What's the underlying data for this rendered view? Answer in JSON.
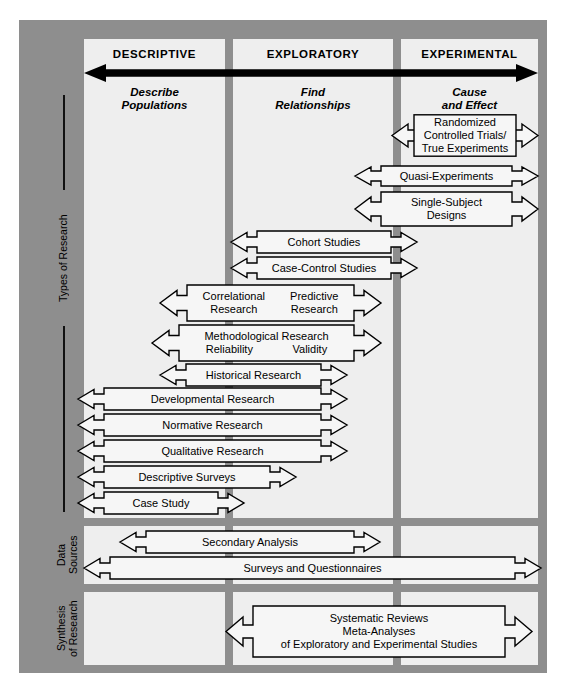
{
  "columns": [
    {
      "heading": "DESCRIPTIVE",
      "subtitle_line1": "Describe",
      "subtitle_line2": "Populations"
    },
    {
      "heading": "EXPLORATORY",
      "subtitle_line1": "Find",
      "subtitle_line2": "Relationships"
    },
    {
      "heading": "EXPERIMENTAL",
      "subtitle_line1": "Cause",
      "subtitle_line2": "and Effect"
    }
  ],
  "continuum_arrow": {
    "name": "double-headed-continuum-arrow",
    "color": "#000000"
  },
  "row_labels": [
    {
      "id": "types-of-research",
      "text": "Types of Research"
    },
    {
      "id": "data-sources",
      "line1": "Data",
      "line2": "Sources"
    },
    {
      "id": "synthesis-of-research",
      "line1": "Synthesis",
      "line2": "of Research"
    }
  ],
  "bands": {
    "types_of_research": [
      {
        "id": "randomized-controlled-trials",
        "lines": [
          "Randomized",
          "Controlled Trials/",
          "True Experiments"
        ],
        "span": "experimental"
      },
      {
        "id": "quasi-experiments",
        "lines": [
          "Quasi-Experiments"
        ],
        "span": "experimental"
      },
      {
        "id": "single-subject-designs",
        "lines": [
          "Single-Subject",
          "Designs"
        ],
        "span": "experimental"
      },
      {
        "id": "cohort-studies",
        "lines": [
          "Cohort Studies"
        ],
        "span": "exploratory-experimental"
      },
      {
        "id": "case-control-studies",
        "lines": [
          "Case-Control Studies"
        ],
        "span": "exploratory-experimental"
      },
      {
        "id": "correlational-predictive-research",
        "two_col": [
          "Correlational\nResearch",
          "Predictive\nResearch"
        ],
        "lines": [
          "Correlational",
          "Research",
          "Predictive",
          "Research"
        ],
        "span": "descriptive-exploratory"
      },
      {
        "id": "methodological-research",
        "two_col": [
          "Methodological Research",
          "Reliability",
          "Validity"
        ],
        "lines": [
          "Methodological Research",
          "Reliability",
          "Validity"
        ],
        "span": "descriptive-exploratory"
      },
      {
        "id": "historical-research",
        "lines": [
          "Historical Research"
        ],
        "span": "descriptive-exploratory"
      },
      {
        "id": "developmental-research",
        "lines": [
          "Developmental Research"
        ],
        "span": "descriptive-exploratory"
      },
      {
        "id": "normative-research",
        "lines": [
          "Normative Research"
        ],
        "span": "descriptive-exploratory"
      },
      {
        "id": "qualitative-research",
        "lines": [
          "Qualitative Research"
        ],
        "span": "descriptive-exploratory"
      },
      {
        "id": "descriptive-surveys",
        "lines": [
          "Descriptive Surveys"
        ],
        "span": "descriptive"
      },
      {
        "id": "case-study",
        "lines": [
          "Case Study"
        ],
        "span": "descriptive"
      }
    ],
    "data_sources": [
      {
        "id": "secondary-analysis",
        "lines": [
          "Secondary Analysis"
        ],
        "span": "descriptive-exploratory"
      },
      {
        "id": "surveys-and-questionnaires",
        "lines": [
          "Surveys and Questionnaires"
        ],
        "span": "all"
      }
    ],
    "synthesis_of_research": [
      {
        "id": "systematic-reviews-meta-analyses",
        "lines": [
          "Systematic Reviews",
          "Meta-Analyses",
          "of Exploratory and Experimental Studies"
        ],
        "span": "exploratory-experimental"
      }
    ]
  },
  "colors": {
    "frame": "#8e8e8e",
    "panel": "#eeeeee",
    "arrow_fill": "#f6f6f6",
    "arrow_stroke": "#000000",
    "continuum": "#000000"
  }
}
